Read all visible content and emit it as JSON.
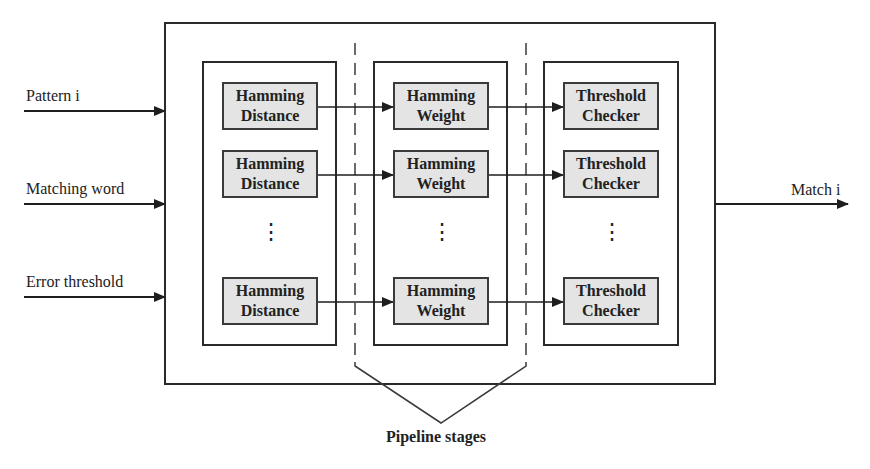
{
  "diagram": {
    "inputs": [
      {
        "label": "Pattern i",
        "y": 109
      },
      {
        "label": "Matching word",
        "y": 203
      },
      {
        "label": "Error threshold",
        "y": 296
      }
    ],
    "output": {
      "label": "Match i",
      "y": 204
    },
    "columns": [
      {
        "name": "hamming-distance",
        "blocks": [
          {
            "line1": "Hamming",
            "line2": "Distance"
          },
          {
            "line1": "Hamming",
            "line2": "Distance"
          },
          {
            "line1": "Hamming",
            "line2": "Distance"
          }
        ],
        "ellipsis": "⋮"
      },
      {
        "name": "hamming-weight",
        "blocks": [
          {
            "line1": "Hamming",
            "line2": "Weight"
          },
          {
            "line1": "Hamming",
            "line2": "Weight"
          },
          {
            "line1": "Hamming",
            "line2": "Weight"
          }
        ],
        "ellipsis": "⋮"
      },
      {
        "name": "threshold-checker",
        "blocks": [
          {
            "line1": "Threshold",
            "line2": "Checker"
          },
          {
            "line1": "Threshold",
            "line2": "Checker"
          },
          {
            "line1": "Threshold",
            "line2": "Checker"
          }
        ],
        "ellipsis": "⋮"
      }
    ],
    "caption": "Pipeline stages",
    "colors": {
      "stroke": "#2a2a2a",
      "block_fill": "#e4e4e4",
      "background": "#ffffff"
    }
  }
}
